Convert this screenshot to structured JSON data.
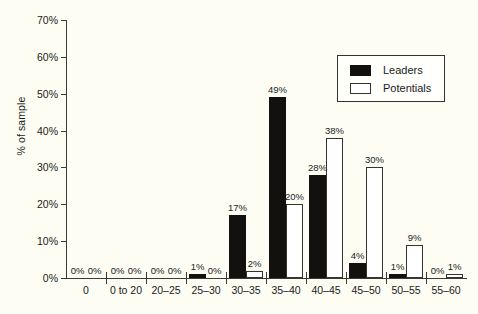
{
  "chart_data": {
    "type": "bar",
    "title": "",
    "subtitle": "",
    "xlabel": "",
    "ylabel": "% of sample",
    "ylim": [
      0,
      70
    ],
    "yticks": [
      0,
      10,
      20,
      30,
      40,
      50,
      60,
      70
    ],
    "ytick_labels": [
      "0%",
      "10%",
      "20%",
      "30%",
      "40%",
      "50%",
      "60%",
      "70%"
    ],
    "grid": false,
    "legend_position": "top-right",
    "categories": [
      "0",
      "0 to 20",
      "20–25",
      "25–30",
      "30–35",
      "35–40",
      "40–45",
      "45–50",
      "50–55",
      "55–60"
    ],
    "series": [
      {
        "name": "Leaders",
        "color": "#13110e",
        "style": "filled",
        "values": [
          0,
          0,
          0,
          1,
          17,
          49,
          28,
          4,
          1,
          0
        ],
        "labels": [
          "0%",
          "0%",
          "0%",
          "1%",
          "17%",
          "49%",
          "28%",
          "4%",
          "1%",
          "0%"
        ]
      },
      {
        "name": "Potentials",
        "color": "#ffffff",
        "style": "outlined",
        "values": [
          0,
          0,
          0,
          0,
          2,
          20,
          38,
          30,
          9,
          1
        ],
        "labels": [
          "0%",
          "0%",
          "0%",
          "0%",
          "2%",
          "20%",
          "38%",
          "30%",
          "9%",
          "1%"
        ]
      }
    ]
  },
  "legend": {
    "entries": [
      {
        "label": "Leaders"
      },
      {
        "label": "Potentials"
      }
    ]
  }
}
